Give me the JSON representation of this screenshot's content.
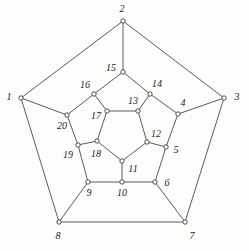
{
  "figure": {
    "width": 249,
    "height": 251,
    "background_color": "#fdfdfc",
    "edge_color": "#4a4a4a",
    "vertex_fill": "#ffffff",
    "vertex_stroke": "#3c3c3c",
    "label_color": "#1d1d1d"
  },
  "chart_data": {
    "type": "diagram",
    "subtype": "node-link-graph",
    "title": "",
    "vertex_count": 20,
    "edge_count": 30,
    "nodes": [
      {
        "id": 1,
        "label": "1",
        "x": 21,
        "y": 98,
        "label_x": 9,
        "label_y": 97
      },
      {
        "id": 2,
        "label": "2",
        "x": 123,
        "y": 21,
        "label_x": 122,
        "label_y": 9
      },
      {
        "id": 3,
        "label": "3",
        "x": 224,
        "y": 98,
        "label_x": 237,
        "label_y": 97
      },
      {
        "id": 4,
        "label": "4",
        "x": 178,
        "y": 114,
        "label_x": 183,
        "label_y": 103
      },
      {
        "id": 5,
        "label": "5",
        "x": 166,
        "y": 147,
        "label_x": 176,
        "label_y": 150
      },
      {
        "id": 6,
        "label": "6",
        "x": 155,
        "y": 182,
        "label_x": 167,
        "label_y": 183
      },
      {
        "id": 7,
        "label": "7",
        "x": 185,
        "y": 222,
        "label_x": 192,
        "label_y": 236
      },
      {
        "id": 8,
        "label": "8",
        "x": 59,
        "y": 222,
        "label_x": 58,
        "label_y": 236
      },
      {
        "id": 9,
        "label": "9",
        "x": 88,
        "y": 182,
        "label_x": 89,
        "label_y": 193
      },
      {
        "id": 10,
        "label": "10",
        "x": 122,
        "y": 182,
        "label_x": 122,
        "label_y": 193
      },
      {
        "id": 11,
        "label": "11",
        "x": 122,
        "y": 161,
        "label_x": 133,
        "label_y": 169
      },
      {
        "id": 12,
        "label": "12",
        "x": 147,
        "y": 142,
        "label_x": 156,
        "label_y": 134
      },
      {
        "id": 13,
        "label": "13",
        "x": 138,
        "y": 111,
        "label_x": 133,
        "label_y": 101
      },
      {
        "id": 14,
        "label": "14",
        "x": 150,
        "y": 94,
        "label_x": 157,
        "label_y": 84
      },
      {
        "id": 15,
        "label": "15",
        "x": 123,
        "y": 72,
        "label_x": 111,
        "label_y": 68
      },
      {
        "id": 16,
        "label": "16",
        "x": 94,
        "y": 94,
        "label_x": 85,
        "label_y": 85
      },
      {
        "id": 17,
        "label": "17",
        "x": 107,
        "y": 111,
        "label_x": 96,
        "label_y": 116
      },
      {
        "id": 18,
        "label": "18",
        "x": 97,
        "y": 141,
        "label_x": 96,
        "label_y": 154
      },
      {
        "id": 19,
        "label": "19",
        "x": 78,
        "y": 145,
        "label_x": 68,
        "label_y": 155
      },
      {
        "id": 20,
        "label": "20",
        "x": 67,
        "y": 115,
        "label_x": 62,
        "label_y": 126
      }
    ],
    "edges": [
      [
        1,
        2
      ],
      [
        2,
        3
      ],
      [
        1,
        8
      ],
      [
        3,
        7
      ],
      [
        7,
        8
      ],
      [
        2,
        15
      ],
      [
        1,
        20
      ],
      [
        3,
        4
      ],
      [
        7,
        6
      ],
      [
        8,
        9
      ],
      [
        15,
        16
      ],
      [
        15,
        14
      ],
      [
        16,
        20
      ],
      [
        16,
        17
      ],
      [
        20,
        19
      ],
      [
        14,
        4
      ],
      [
        14,
        13
      ],
      [
        4,
        5
      ],
      [
        5,
        12
      ],
      [
        5,
        6
      ],
      [
        6,
        10
      ],
      [
        9,
        10
      ],
      [
        9,
        19
      ],
      [
        19,
        18
      ],
      [
        18,
        17
      ],
      [
        17,
        13
      ],
      [
        13,
        12
      ],
      [
        12,
        11
      ],
      [
        11,
        18
      ],
      [
        10,
        11
      ]
    ],
    "outer_cycle": [
      1,
      2,
      3,
      7,
      8
    ],
    "inner_cycle": [
      17,
      13,
      12,
      11,
      18
    ],
    "middle_cycle": [
      15,
      14,
      4,
      5,
      6,
      10,
      9,
      19,
      20,
      16
    ]
  }
}
